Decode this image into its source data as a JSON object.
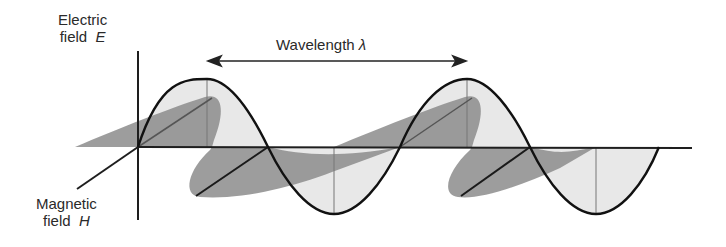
{
  "diagram": {
    "labels": {
      "electric_line1": "Electric",
      "electric_line2_text": "field",
      "electric_symbol": "E",
      "magnetic_line1": "Magnetic",
      "magnetic_line2_text": "field",
      "magnetic_symbol": "H",
      "wavelength_text": "Wavelength",
      "wavelength_symbol": "λ"
    },
    "colors": {
      "curve": "#111111",
      "axis": "#222222",
      "e_fill": "#e6e6e6",
      "h_fill": "#8a8a8a",
      "h_fill_light": "#b5b5b5",
      "text": "#2a2a2a"
    }
  }
}
